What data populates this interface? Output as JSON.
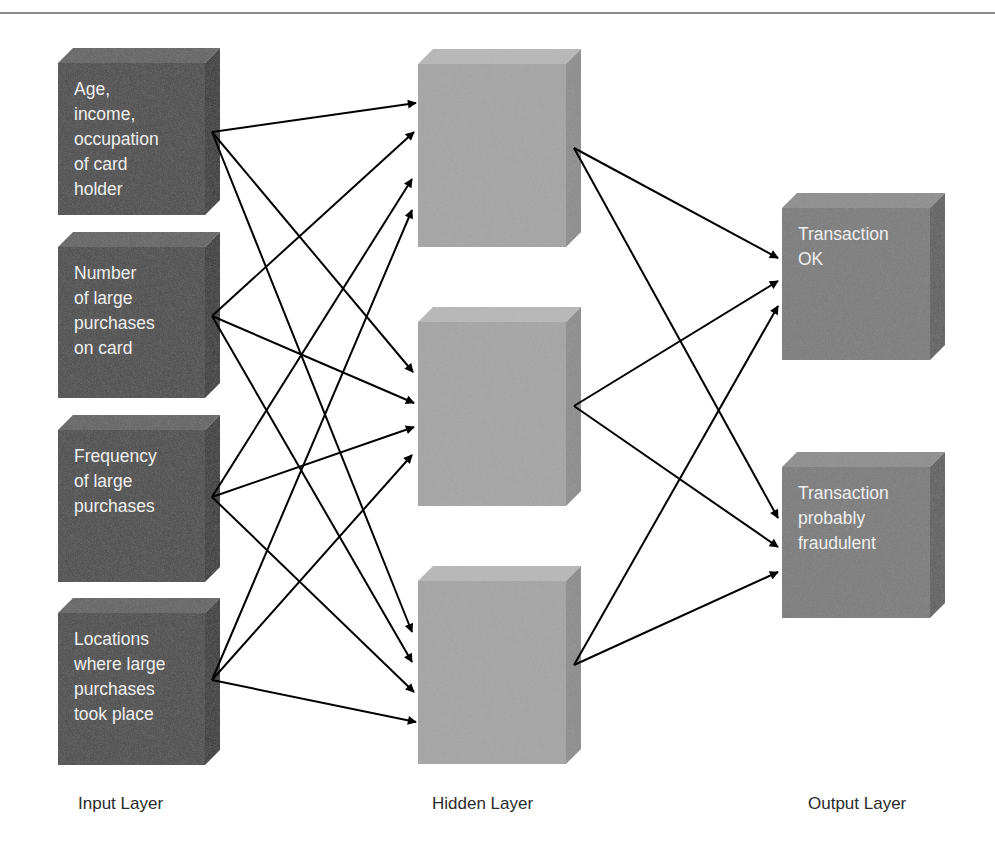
{
  "diagram": {
    "title": "",
    "colors": {
      "input_front": "#4a4a4a",
      "input_top": "#626262",
      "input_side": "#363636",
      "hidden_front": "#a4a4a4",
      "hidden_top": "#b8b8b8",
      "hidden_side": "#8c8c8c",
      "output_front": "#7a7a7a",
      "output_top": "#8d8d8d",
      "output_side": "#5f5f5f",
      "arrow": "#000000",
      "rule": "#8a8a8a"
    },
    "layers": {
      "input": {
        "label": "Input Layer",
        "nodes": [
          {
            "id": "in1",
            "text": "Age,\nincome,\noccupation\nof card\nholder",
            "x": 58,
            "y": 63,
            "w": 147,
            "h": 152,
            "out": [
              212,
              132
            ]
          },
          {
            "id": "in2",
            "text": "Number\nof large\npurchases\non card",
            "x": 58,
            "y": 247,
            "w": 147,
            "h": 151,
            "out": [
              212,
              316
            ]
          },
          {
            "id": "in3",
            "text": "Frequency\nof large\npurchases",
            "x": 58,
            "y": 430,
            "w": 147,
            "h": 152,
            "out": [
              212,
              497
            ]
          },
          {
            "id": "in4",
            "text": "Locations\nwhere large\npurchases\ntook place",
            "x": 58,
            "y": 613,
            "w": 147,
            "h": 152,
            "out": [
              212,
              680
            ]
          }
        ]
      },
      "hidden": {
        "label": "Hidden Layer",
        "nodes": [
          {
            "id": "h1",
            "x": 418,
            "y": 64,
            "w": 148,
            "h": 183,
            "out": [
              574,
              148
            ]
          },
          {
            "id": "h2",
            "x": 418,
            "y": 322,
            "w": 148,
            "h": 184,
            "out": [
              574,
              406
            ]
          },
          {
            "id": "h3",
            "x": 418,
            "y": 581,
            "w": 148,
            "h": 183,
            "out": [
              574,
              665
            ]
          }
        ]
      },
      "output": {
        "label": "Output Layer",
        "nodes": [
          {
            "id": "o1",
            "text": "Transaction\nOK",
            "x": 782,
            "y": 208,
            "w": 148,
            "h": 152
          },
          {
            "id": "o2",
            "text": "Transaction\nprobably\nfraudulent",
            "x": 782,
            "y": 467,
            "w": 148,
            "h": 151
          }
        ]
      }
    },
    "edges": [
      {
        "from": "in1",
        "to": "h1",
        "end": [
          416,
          103
        ]
      },
      {
        "from": "in1",
        "to": "h2",
        "end": [
          413,
          372
        ]
      },
      {
        "from": "in1",
        "to": "h3",
        "end": [
          412,
          632
        ]
      },
      {
        "from": "in2",
        "to": "h1",
        "end": [
          414,
          132
        ]
      },
      {
        "from": "in2",
        "to": "h2",
        "end": [
          414,
          403
        ]
      },
      {
        "from": "in2",
        "to": "h3",
        "end": [
          412,
          662
        ]
      },
      {
        "from": "in3",
        "to": "h1",
        "end": [
          412,
          179
        ]
      },
      {
        "from": "in3",
        "to": "h2",
        "end": [
          414,
          427
        ]
      },
      {
        "from": "in3",
        "to": "h3",
        "end": [
          414,
          692
        ]
      },
      {
        "from": "in4",
        "to": "h1",
        "end": [
          412,
          210
        ]
      },
      {
        "from": "in4",
        "to": "h2",
        "end": [
          412,
          455
        ]
      },
      {
        "from": "in4",
        "to": "h3",
        "end": [
          416,
          722
        ]
      },
      {
        "from": "h1",
        "to": "o1",
        "end": [
          778,
          258
        ]
      },
      {
        "from": "h1",
        "to": "o2",
        "end": [
          778,
          518
        ]
      },
      {
        "from": "h2",
        "to": "o1",
        "end": [
          778,
          281
        ]
      },
      {
        "from": "h2",
        "to": "o2",
        "end": [
          778,
          547
        ]
      },
      {
        "from": "h3",
        "to": "o1",
        "end": [
          778,
          306
        ]
      },
      {
        "from": "h3",
        "to": "o2",
        "end": [
          778,
          572
        ]
      }
    ]
  }
}
